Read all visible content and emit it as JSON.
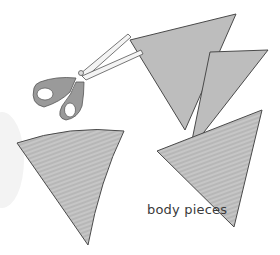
{
  "illustration": {
    "caption": "body pieces",
    "colors": {
      "fabric_fill": "#b9b9b9",
      "fabric_stripe": "#c9c9c9",
      "outline": "#4a4a4a",
      "scissor_handle": "#9a9a9a",
      "scissor_blade": "#f4f4f4",
      "background_blob": "#f3f3f3"
    },
    "pieces": [
      {
        "name": "top-triangle-piece",
        "shape": "triangle"
      },
      {
        "name": "middle-triangle-piece",
        "shape": "triangle"
      },
      {
        "name": "bottom-right-triangle-piece",
        "shape": "triangle"
      },
      {
        "name": "left-curved-triangle-piece",
        "shape": "curved-triangle"
      }
    ],
    "tool": "scissors"
  }
}
